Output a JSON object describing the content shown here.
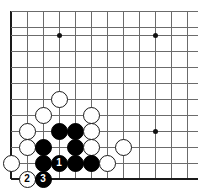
{
  "figure": {
    "kind": "go-board-diagram",
    "width": 198,
    "height": 195,
    "board_colors": {
      "background": "#ffffff",
      "grid": "#6b6b6b",
      "edge": "#1a1a1a",
      "black_stone": "#000000",
      "white_stone": "#ffffff",
      "star_point": "#111111"
    }
  },
  "board": {
    "origin_x": 11,
    "origin_y": 11,
    "spacing": 16,
    "columns": 12,
    "rows": 11,
    "vertical_lines_x": [
      11,
      27,
      43,
      59,
      75,
      91,
      107,
      123,
      139,
      155,
      171,
      187
    ],
    "horizontal_lines_y": [
      11,
      27,
      35,
      51,
      67,
      83,
      99,
      115,
      131,
      147,
      163,
      179
    ],
    "edges": {
      "left": 11,
      "bottom": 179
    },
    "star_points": [
      {
        "x": 59,
        "y": 35
      },
      {
        "x": 155,
        "y": 35
      },
      {
        "x": 155,
        "y": 131
      }
    ]
  },
  "stones": [
    {
      "color": "white",
      "x": 59,
      "y": 99,
      "label": ""
    },
    {
      "color": "white",
      "x": 43,
      "y": 115,
      "label": ""
    },
    {
      "color": "white",
      "x": 91,
      "y": 115,
      "label": ""
    },
    {
      "color": "white",
      "x": 27,
      "y": 131,
      "label": ""
    },
    {
      "color": "black",
      "x": 59,
      "y": 131,
      "label": ""
    },
    {
      "color": "black",
      "x": 75,
      "y": 131,
      "label": ""
    },
    {
      "color": "white",
      "x": 91,
      "y": 131,
      "label": ""
    },
    {
      "color": "white",
      "x": 27,
      "y": 147,
      "label": ""
    },
    {
      "color": "black",
      "x": 43,
      "y": 147,
      "label": ""
    },
    {
      "color": "black",
      "x": 75,
      "y": 147,
      "label": ""
    },
    {
      "color": "white",
      "x": 91,
      "y": 147,
      "label": ""
    },
    {
      "color": "white",
      "x": 123,
      "y": 147,
      "label": ""
    },
    {
      "color": "white",
      "x": 11,
      "y": 163,
      "label": ""
    },
    {
      "color": "black",
      "x": 43,
      "y": 163,
      "label": ""
    },
    {
      "color": "black",
      "x": 59,
      "y": 163,
      "label": "1"
    },
    {
      "color": "black",
      "x": 75,
      "y": 163,
      "label": ""
    },
    {
      "color": "black",
      "x": 91,
      "y": 163,
      "label": ""
    },
    {
      "color": "white",
      "x": 107,
      "y": 163,
      "label": ""
    },
    {
      "color": "white",
      "x": 27,
      "y": 179,
      "label": "2"
    },
    {
      "color": "black",
      "x": 43,
      "y": 179,
      "label": "3"
    }
  ],
  "move_sequence": [
    {
      "number": "1",
      "color": "black",
      "x": 59,
      "y": 163
    },
    {
      "number": "2",
      "color": "white",
      "x": 27,
      "y": 179
    },
    {
      "number": "3",
      "color": "black",
      "x": 43,
      "y": 179
    }
  ]
}
